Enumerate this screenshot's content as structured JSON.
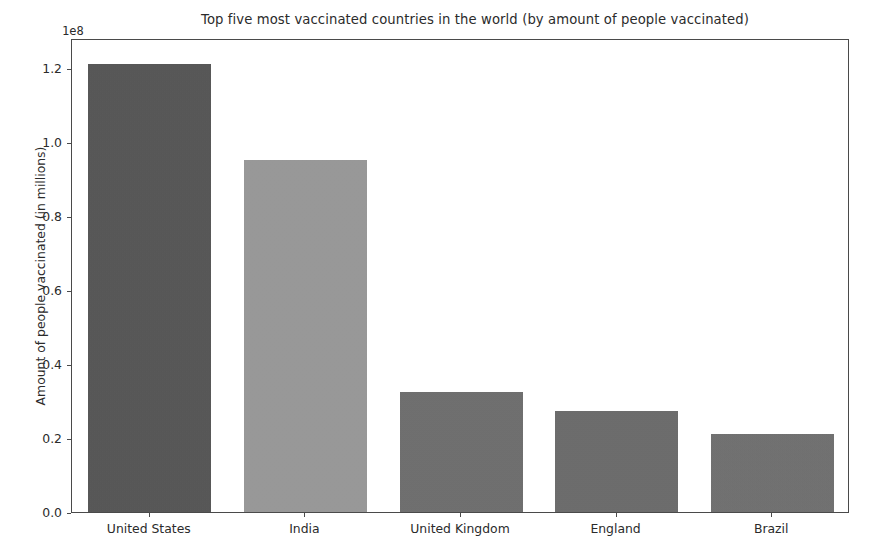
{
  "chart_data": {
    "type": "bar",
    "title": "Top five most vaccinated countries in the world (by amount of people vaccinated)",
    "xlabel": "",
    "ylabel": "Amount of people vaccinated (in millions)",
    "categories": [
      "United States",
      "India",
      "United Kingdom",
      "England",
      "Brazil"
    ],
    "values": [
      121000000,
      95000000,
      32300000,
      27300000,
      21000000
    ],
    "value_labels": [
      "1.21e8",
      "0.95e8",
      "0.323e8",
      "0.273e8",
      "0.21e8"
    ],
    "ylim": [
      0,
      128000000
    ],
    "yticks": [
      0,
      20000000,
      40000000,
      60000000,
      80000000,
      100000000,
      120000000
    ],
    "ytick_labels": [
      "0.0",
      "0.2",
      "0.4",
      "0.6",
      "0.8",
      "1.0",
      "1.2"
    ],
    "y_offset_text": "1e8",
    "grid": false,
    "legend": null,
    "bar_colors": [
      "#555555",
      "#9a9a9a",
      "#6e6e6e",
      "#6b6b6b",
      "#707070"
    ]
  },
  "axes": {
    "spine_color": "#4a4a4a",
    "tick_color": "#4a4a4a",
    "text_color": "#2b2b2b"
  }
}
